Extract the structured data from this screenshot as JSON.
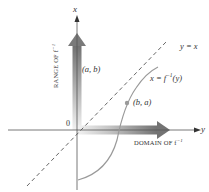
{
  "diagram": {
    "axes": {
      "vertical_label": "x",
      "horizontal_label": "y",
      "origin_label": "0"
    },
    "range_arrow_label": "RANGE OF f",
    "range_arrow_label_sup": "−1",
    "domain_arrow_label": "DOMAIN OF f",
    "domain_arrow_label_sup": "−1",
    "line_label": "y = x",
    "curve_label": "x = f",
    "curve_label_sup": "−1",
    "curve_label_tail": "(y)",
    "point_ab_label": "(a, b)",
    "point_ba_label": "(b, a)",
    "colors": {
      "axis": "#555555",
      "arrow_dark": "#6e6e6e",
      "arrow_light": "#e0e0e0",
      "curve": "#9a9a9a",
      "dashed_line": "#555555",
      "text": "#333333"
    }
  }
}
